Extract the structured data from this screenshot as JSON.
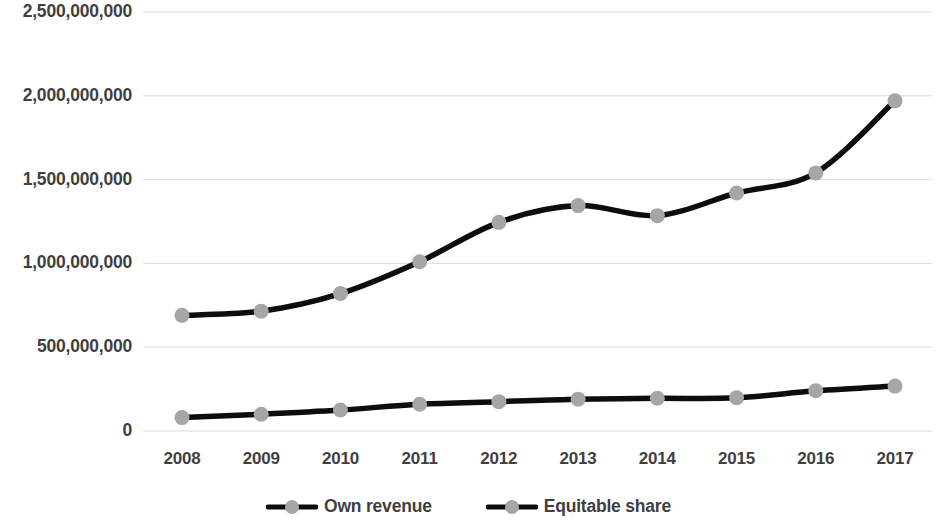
{
  "chart_data": {
    "type": "line",
    "title": "",
    "subtitle": "",
    "xlabel": "",
    "ylabel": "",
    "categories": [
      "2008",
      "2009",
      "2010",
      "2011",
      "2012",
      "2013",
      "2014",
      "2015",
      "2016",
      "2017"
    ],
    "series": [
      {
        "name": "Own revenue",
        "values": [
          80000000,
          100000000,
          125000000,
          160000000,
          175000000,
          190000000,
          195000000,
          198000000,
          240000000,
          268000000
        ],
        "line_color": "#0d0d0d",
        "marker_color": "#a6a6a6"
      },
      {
        "name": "Equitable share",
        "values": [
          690000000,
          715000000,
          820000000,
          1010000000,
          1245000000,
          1345000000,
          1285000000,
          1420000000,
          1540000000,
          1970000000
        ],
        "line_color": "#0d0d0d",
        "marker_color": "#a6a6a6"
      }
    ],
    "ylim": [
      0,
      2500000000
    ],
    "ytick_values": [
      0,
      500000000,
      1000000000,
      1500000000,
      2000000000,
      2500000000
    ],
    "ytick_labels": [
      "0",
      "500,000,000",
      "1,000,000,000",
      "1,500,000,000",
      "2,000,000,000",
      "2,500,000,000"
    ],
    "grid": true,
    "grid_axis": "y",
    "grid_color": "#d9d9d9",
    "legend_position": "bottom",
    "legend_entries": [
      "Own revenue",
      "Equitable share"
    ],
    "background": "#ffffff",
    "text_color": "#3f3f3f"
  }
}
